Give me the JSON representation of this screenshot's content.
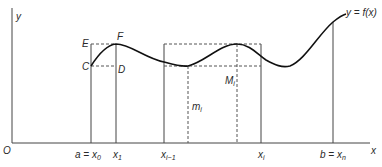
{
  "diagram": {
    "type": "riemann-sum-illustration",
    "axes": {
      "x_label": "x",
      "y_label": "y",
      "origin_label": "O"
    },
    "curve_label": "y = f(x)",
    "points": {
      "E": "E",
      "F": "F",
      "C": "C",
      "D": "D"
    },
    "interval_labels": {
      "M": "M",
      "M_sub": "i",
      "m": "m",
      "m_sub": "i"
    },
    "x_ticks": [
      {
        "main": "a = x",
        "sub": "0"
      },
      {
        "main": "x",
        "sub": "1"
      },
      {
        "main": "x",
        "sub": "i−1"
      },
      {
        "main": "x",
        "sub": "i"
      },
      {
        "main": "b = x",
        "sub": "n"
      }
    ],
    "colors": {
      "stroke": "#1a1a1a",
      "dashed": "#555555",
      "background": "#ffffff"
    }
  }
}
